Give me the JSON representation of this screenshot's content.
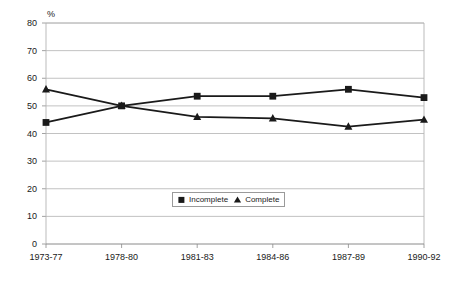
{
  "chart_data": {
    "type": "line",
    "title": "",
    "xlabel": "",
    "ylabel": "%",
    "ylim": [
      0,
      80
    ],
    "ytick_step": 10,
    "grid": true,
    "legend_position": "inside-bottom-center",
    "categories": [
      "1973-77",
      "1978-80",
      "1981-83",
      "1984-86",
      "1987-89",
      "1990-92"
    ],
    "yticks": [
      "0",
      "10",
      "20",
      "30",
      "40",
      "50",
      "60",
      "70",
      "80"
    ],
    "series": [
      {
        "name": "Incomplete",
        "marker": "square",
        "color": "#1a1a1a",
        "values": [
          44,
          50,
          53.5,
          53.5,
          56,
          53
        ]
      },
      {
        "name": "Complete",
        "marker": "triangle",
        "color": "#1a1a1a",
        "values": [
          56,
          50,
          46,
          45.5,
          42.5,
          45
        ]
      }
    ]
  },
  "axis": {
    "unit_label": "%"
  },
  "legend": {
    "items": [
      {
        "label": "Incomplete",
        "marker": "square-marker-icon"
      },
      {
        "label": "Complete",
        "marker": "triangle-marker-icon"
      }
    ]
  }
}
